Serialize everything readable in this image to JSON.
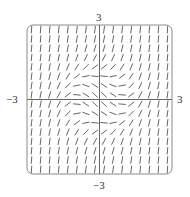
{
  "figure": {
    "type": "slope_field",
    "x_range": [
      -3,
      3
    ],
    "y_range": [
      -3,
      3
    ],
    "labels": {
      "y_top": "3",
      "y_bottom": "−3",
      "x_left": "−3",
      "x_right": "3"
    },
    "grid": {
      "cols": 16,
      "rows": 16
    },
    "frame": {
      "rounded": true,
      "color": "#8a8a8a"
    },
    "segment_color": "#555555",
    "axis_color": "#666666",
    "slope_model": "x^2 + y^2 - 1"
  }
}
